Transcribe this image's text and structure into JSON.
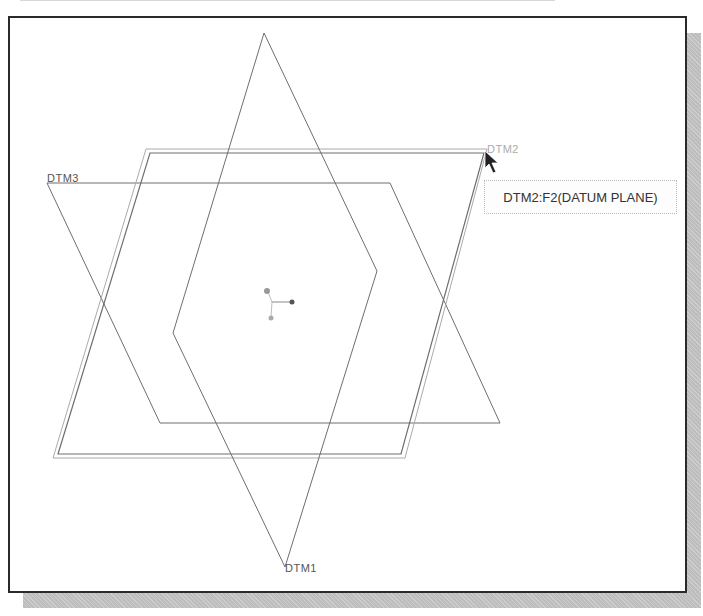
{
  "viewport": {
    "planes": [
      {
        "name": "DTM1",
        "label": "DTM1",
        "points": [
          [
            264,
            33
          ],
          [
            377,
            271
          ],
          [
            285,
            567
          ],
          [
            173,
            333
          ]
        ],
        "highlighted": false
      },
      {
        "name": "DTM2",
        "label": "DTM2",
        "points": [
          [
            146,
            149
          ],
          [
            487,
            149
          ],
          [
            405,
            458
          ],
          [
            53,
            458
          ]
        ],
        "inner_points": [
          [
            150,
            153
          ],
          [
            484,
            153
          ],
          [
            401,
            454
          ],
          [
            58,
            454
          ]
        ],
        "highlighted": true
      },
      {
        "name": "DTM3",
        "label": "DTM3",
        "points": [
          [
            47,
            183
          ],
          [
            390,
            183
          ],
          [
            500,
            423
          ],
          [
            160,
            423
          ]
        ],
        "highlighted": false
      }
    ],
    "labels": {
      "dtm1": "DTM1",
      "dtm2": "DTM2",
      "dtm3": "DTM3"
    },
    "tooltip": "DTM2:F2(DATUM PLANE)",
    "coordinate_triad": {
      "center": [
        272,
        302
      ]
    },
    "colors": {
      "plane_line": "#777777",
      "highlight_line": "#999999",
      "frame": "#2a2a2a",
      "shadow": "#bdbdbd"
    }
  }
}
